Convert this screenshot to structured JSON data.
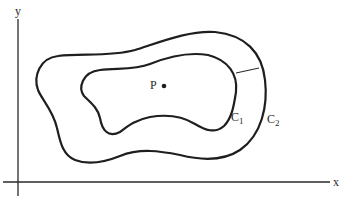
{
  "figure": {
    "axes": {
      "x_label": "x",
      "y_label": "y"
    },
    "point": {
      "label": "P"
    },
    "curves": {
      "inner": {
        "label_main": "C",
        "label_sub": "1"
      },
      "outer": {
        "label_main": "C",
        "label_sub": "2"
      }
    },
    "colors": {
      "ink": "#1e1e1e",
      "background": "#ffffff"
    }
  }
}
